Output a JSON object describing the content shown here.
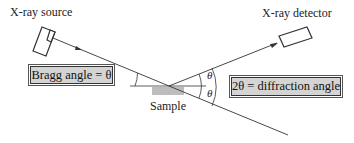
{
  "labels": {
    "source": "X-ray source",
    "detector": "X-ray detector",
    "sample": "Sample",
    "theta_upper": "θ",
    "theta_lower": "θ"
  },
  "boxes": {
    "bragg": "Bragg angle = θ",
    "diffraction": "2θ = diffraction angle"
  },
  "colors": {
    "box_fill": "#d4d4d4",
    "line": "#333333"
  }
}
